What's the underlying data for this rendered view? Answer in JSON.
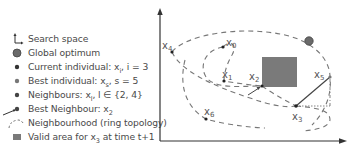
{
  "legend": {
    "items": [
      {
        "icon": "search-space-axes-icon",
        "text": "Search space"
      },
      {
        "icon": "global-optimum-dot-icon",
        "text": "Global optimum"
      },
      {
        "icon": "current-individual-dot-icon",
        "text": "Current individual: x",
        "sub": "i",
        "suffix": ", i = 3"
      },
      {
        "icon": "best-individual-dot-icon",
        "text": "Best individual: x",
        "sub": "s",
        "suffix": ", s = 5"
      },
      {
        "icon": "neighbours-dot-icon",
        "text": "Neighbours: x",
        "sub": "l",
        "suffix": ", l ∈ {2, 4}"
      },
      {
        "icon": "best-neighbour-arrow-icon",
        "text": "Best Neighbour: x",
        "sub": "2",
        "suffix": ""
      },
      {
        "icon": "neighbourhood-dashed-icon",
        "text": "Neighbourhood (ring topology)",
        "sub": "",
        "suffix": ""
      },
      {
        "icon": "valid-area-square-icon",
        "text": "Valid area for x",
        "sub": "3",
        "suffix": " at time t+1"
      }
    ]
  },
  "figure": {
    "colors": {
      "axis": "#333333",
      "dash": "#777777",
      "valid_area": "#7a7a7a",
      "optimum": "#666666",
      "point": "#222222"
    },
    "points": [
      {
        "name": "x",
        "sub": "0",
        "x": 223,
        "y": 47
      },
      {
        "name": "x",
        "sub": "1",
        "x": 224,
        "y": 81
      },
      {
        "name": "x",
        "sub": "2",
        "x": 262,
        "y": 86
      },
      {
        "name": "x",
        "sub": "3",
        "x": 296,
        "y": 106
      },
      {
        "name": "x",
        "sub": "4",
        "x": 172,
        "y": 52
      },
      {
        "name": "x",
        "sub": "5",
        "x": 330,
        "y": 77
      },
      {
        "name": "x",
        "sub": "6",
        "x": 206,
        "y": 119
      }
    ],
    "labels": {
      "x0": "x",
      "x0_sub": "0",
      "x1": "x",
      "x1_sub": "1",
      "x2": "x",
      "x2_sub": "2",
      "x3": "x",
      "x3_sub": "3",
      "x4": "x",
      "x4_sub": "4",
      "x5": "x",
      "x5_sub": "5",
      "x6": "x",
      "x6_sub": "6"
    }
  }
}
